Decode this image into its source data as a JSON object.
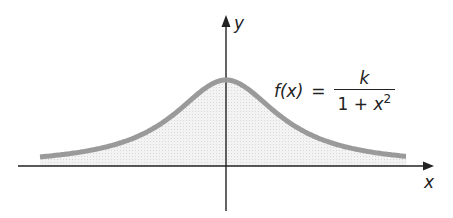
{
  "diagram": {
    "title": "",
    "axes": {
      "x_label": "x",
      "y_label": "y"
    },
    "function": {
      "lhs": "f(x)",
      "equals": "=",
      "numerator": "k",
      "denominator_prefix": "1 + ",
      "denominator_var": "x",
      "denominator_exp": "2"
    },
    "colors": {
      "curve": "#9a9a9a",
      "fill": "#ececec",
      "axis": "#222222"
    }
  }
}
